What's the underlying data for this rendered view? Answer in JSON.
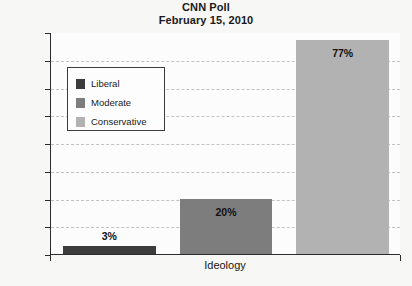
{
  "chart_data": {
    "type": "bar",
    "title": "CNN Poll",
    "subtitle": "February 15, 2010",
    "xlabel": "Ideology",
    "ylabel": "",
    "categories": [
      "Liberal",
      "Moderate",
      "Conservative"
    ],
    "values": [
      3,
      20,
      77
    ],
    "value_labels": [
      "3%",
      "20%",
      "77%"
    ],
    "ylim": [
      0,
      80
    ],
    "ytick_values": [
      0,
      10,
      20,
      30,
      40,
      50,
      60,
      70,
      80
    ],
    "ytick_labels": [
      "0%",
      "10%",
      "20%",
      "30%",
      "40%",
      "50%",
      "60%",
      "70%",
      "80%"
    ],
    "grid": true,
    "legend_position": "upper-left",
    "series_colors": [
      "#3c3c3c",
      "#7d7d7d",
      "#b2b2b2"
    ],
    "legend": [
      {
        "label": "Liberal",
        "color": "#3c3c3c"
      },
      {
        "label": "Moderate",
        "color": "#7d7d7d"
      },
      {
        "label": "Conservative",
        "color": "#b2b2b2"
      }
    ]
  }
}
